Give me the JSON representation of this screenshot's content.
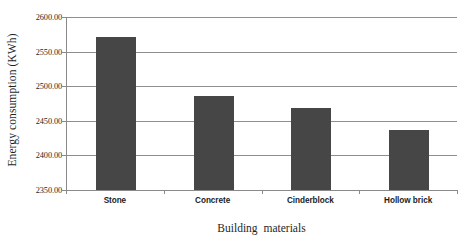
{
  "chart_data": {
    "type": "bar",
    "title": "",
    "xlabel": "Building  materials",
    "ylabel": "Energy consumption (KWh)",
    "categories": [
      "Stone",
      "Concrete",
      "Cinderblock",
      "Hollow brick"
    ],
    "values": [
      2571,
      2486,
      2468,
      2437
    ],
    "ylim": [
      2350,
      2600
    ],
    "ytick_labels": [
      "2600.00",
      "2550.00",
      "2500.00",
      "2450.00",
      "2400.00",
      "2350.00"
    ],
    "ytick_values": [
      2600,
      2550,
      2500,
      2450,
      2400,
      2350
    ],
    "grid": true,
    "legend": "none",
    "bar_color": "#464646",
    "grid_color": "#8e8e8e",
    "axis_color": "#8a8a8a",
    "background": "#ffffff"
  }
}
